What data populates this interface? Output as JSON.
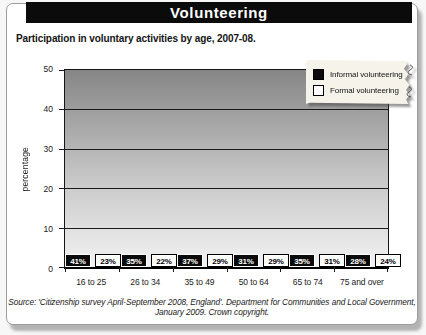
{
  "header": {
    "title": "Volunteering"
  },
  "subtitle": "Participation in voluntary activities by age, 2007-08.",
  "source": "Source: 'Citizenship survey April-September 2008, England'. Department for Communities and Local Government, January 2009. Crown copyright.",
  "chart_data": {
    "type": "bar",
    "title": "Volunteering",
    "subtitle": "Participation in voluntary activities by age, 2007-08.",
    "categories": [
      "16 to 25",
      "26 to 34",
      "35 to 49",
      "50 to 64",
      "65 to 74",
      "75 and over"
    ],
    "series": [
      {
        "name": "Informal volunteering",
        "values": [
          41,
          35,
          37,
          31,
          35,
          28
        ],
        "color": "#0a0a0a",
        "border": "#fdfdfd",
        "text_color": "#ffffff"
      },
      {
        "name": "Formal volunteering",
        "values": [
          23,
          22,
          29,
          29,
          31,
          24
        ],
        "color": "#ffffff",
        "border": "#000000",
        "text_color": "#000000"
      }
    ],
    "xlabel": "",
    "ylabel": "percentage",
    "ylim": [
      0,
      50
    ],
    "yticks": [
      0,
      10,
      20,
      30,
      40,
      50
    ],
    "grid": true,
    "legend_position": "top-right",
    "value_label_suffix": "%",
    "plot_gradient_top": "#868686",
    "plot_gradient_bottom": "#f3f3f3",
    "legend_paper_color": "#f6f4ea"
  }
}
